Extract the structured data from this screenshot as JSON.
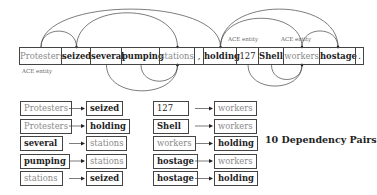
{
  "sentence": {
    "tokens": [
      {
        "text": "Protesters",
        "style": "entity"
      },
      {
        "text": "seized",
        "style": "bold"
      },
      {
        "text": "several",
        "style": "bold"
      },
      {
        "text": "pumping",
        "style": "bold"
      },
      {
        "text": "stations",
        "style": "entity"
      },
      {
        "text": ",",
        "style": "plain"
      },
      {
        "text": "holding",
        "style": "bold"
      },
      {
        "text": "127",
        "style": "plain"
      },
      {
        "text": "Shell",
        "style": "bold"
      },
      {
        "text": "workers",
        "style": "entity"
      },
      {
        "text": "hostage",
        "style": "bold"
      },
      {
        "text": ".",
        "style": "plain"
      }
    ],
    "entity_labels": [
      "ACE entity",
      "ACE entity",
      "ACE entity"
    ]
  },
  "arcs": {
    "above": [
      {
        "from": "Protesters",
        "to": "seized"
      },
      {
        "from": "Protesters",
        "to": "holding"
      },
      {
        "from": "seized",
        "to": "stations"
      },
      {
        "from": "holding",
        "to": "workers"
      },
      {
        "from": "holding",
        "to": "hostage"
      },
      {
        "from": "workers",
        "to": "hostage"
      }
    ],
    "below": [
      {
        "from": "several",
        "to": "stations"
      },
      {
        "from": "pumping",
        "to": "stations"
      },
      {
        "from": "127",
        "to": "workers"
      },
      {
        "from": "Shell",
        "to": "workers"
      }
    ]
  },
  "pairs": [
    {
      "head": {
        "text": "Protesters",
        "style": "entity"
      },
      "dep": {
        "text": "seized",
        "style": "bold"
      }
    },
    {
      "head": {
        "text": "Protesters",
        "style": "entity"
      },
      "dep": {
        "text": "holding",
        "style": "bold"
      }
    },
    {
      "head": {
        "text": "several",
        "style": "bold"
      },
      "dep": {
        "text": "stations",
        "style": "entity"
      }
    },
    {
      "head": {
        "text": "pumping",
        "style": "bold"
      },
      "dep": {
        "text": "stations",
        "style": "entity"
      }
    },
    {
      "head": {
        "text": "stations",
        "style": "entity"
      },
      "dep": {
        "text": "seized",
        "style": "bold"
      }
    },
    {
      "head": {
        "text": "127",
        "style": "plain"
      },
      "dep": {
        "text": "workers",
        "style": "entity"
      }
    },
    {
      "head": {
        "text": "Shell",
        "style": "bold"
      },
      "dep": {
        "text": "workers",
        "style": "entity"
      }
    },
    {
      "head": {
        "text": "workers",
        "style": "entity"
      },
      "dep": {
        "text": "holding",
        "style": "bold"
      }
    },
    {
      "head": {
        "text": "hostage",
        "style": "bold"
      },
      "dep": {
        "text": "workers",
        "style": "entity"
      }
    },
    {
      "head": {
        "text": "hostage",
        "style": "bold"
      },
      "dep": {
        "text": "holding",
        "style": "bold"
      }
    }
  ],
  "summary": "10 Dependency Pairs",
  "colors": {
    "line": "#444444",
    "entity_text": "#8a8a8a",
    "text": "#222222"
  }
}
